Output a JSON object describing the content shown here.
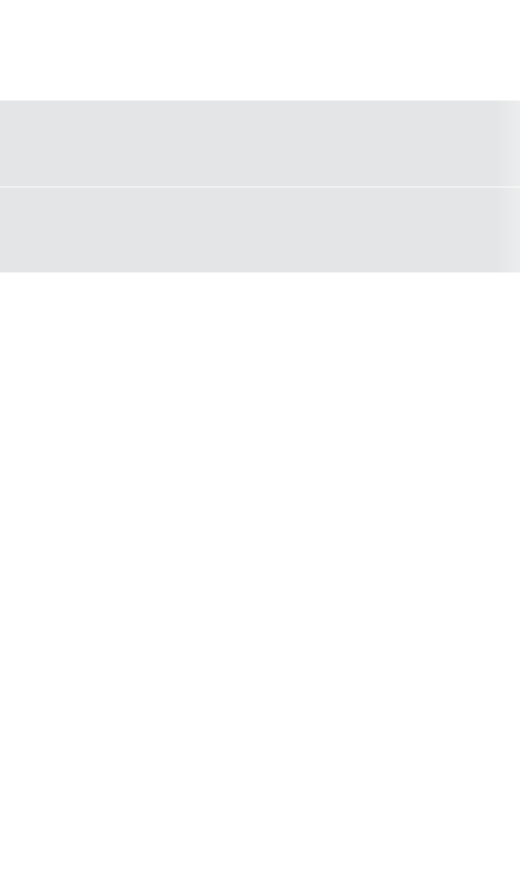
{
  "page": {
    "width": 520,
    "height": 886,
    "background_color": "#ffffff",
    "state_label": "",
    "content_text": ""
  },
  "colors": {
    "page_background": "#ffffff",
    "band_fill": "#e4e5e6",
    "band_seam": "#ebecec",
    "band_edge_highlight": "#f2f2f3"
  },
  "top_spacer": {
    "label": "",
    "height_px": 100
  },
  "placeholder_band": {
    "label": "",
    "top_px": 100,
    "height_px": 173,
    "left_px": 0,
    "width_px": 520,
    "fill": "#e4e5e6",
    "rows": [
      {
        "label": "",
        "top_px": 0,
        "height_px": 86
      },
      {
        "label": "",
        "top_px": 87,
        "height_px": 86
      }
    ],
    "seam": {
      "label": "",
      "top_px": 186,
      "height_px": 2
    }
  },
  "empty_region": {
    "label": "",
    "top_px": 273,
    "height_px": 613,
    "message": ""
  }
}
